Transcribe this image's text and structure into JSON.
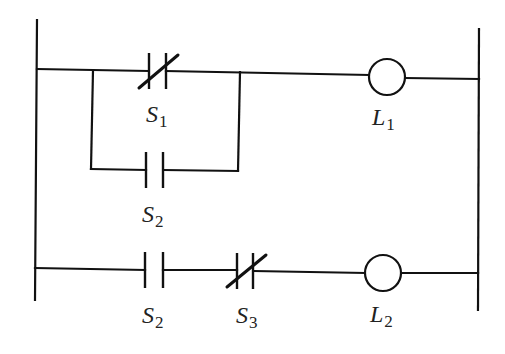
{
  "diagram": {
    "type": "ladder-logic",
    "rails": {
      "left": "left-power-rail",
      "right": "right-power-rail"
    },
    "rungs": [
      {
        "id": "rung-1",
        "elements": [
          {
            "kind": "normally-closed-contact",
            "name": "S",
            "sub": "1",
            "branch": "main"
          },
          {
            "kind": "normally-open-contact",
            "name": "S",
            "sub": "2",
            "branch": "parallel"
          },
          {
            "kind": "coil",
            "name": "L",
            "sub": "1"
          }
        ]
      },
      {
        "id": "rung-2",
        "elements": [
          {
            "kind": "normally-open-contact",
            "name": "S",
            "sub": "2"
          },
          {
            "kind": "normally-closed-contact",
            "name": "S",
            "sub": "3"
          },
          {
            "kind": "coil",
            "name": "L",
            "sub": "2"
          }
        ]
      }
    ]
  },
  "labels": {
    "s1": {
      "main": "S",
      "sub": "1"
    },
    "s2_parallel": {
      "main": "S",
      "sub": "2"
    },
    "l1": {
      "main": "L",
      "sub": "1"
    },
    "s2_rung2": {
      "main": "S",
      "sub": "2"
    },
    "s3": {
      "main": "S",
      "sub": "3"
    },
    "l2": {
      "main": "L",
      "sub": "2"
    }
  },
  "colors": {
    "ink": "#111111",
    "background": "#ffffff"
  }
}
